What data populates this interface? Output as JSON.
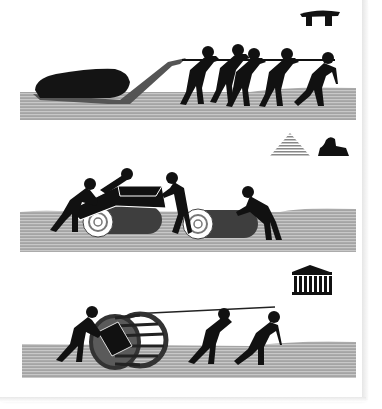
{
  "illustration": {
    "title": "Methods of moving heavy stones in antiquity",
    "colors": {
      "figure": "#111111",
      "stone": "#1a1a1a",
      "ground": "#9a9a9a",
      "ground_stripe": "#bdbdbd",
      "sled": "#5a5a5a",
      "roller": "#4a4a4a",
      "background": "#ffffff"
    },
    "panels": [
      {
        "id": "sledge",
        "era_icon": "dolmen-icon",
        "era_label": "Megalithic (dolmen)",
        "description": "Five figures pull a rope hauling a large stone on a wooden sledge",
        "figure_count": 5
      },
      {
        "id": "rollers",
        "era_icon": "pyramid-sphinx-icon",
        "era_label": "Ancient Egypt (pyramid and sphinx)",
        "description": "Four figures move a stone block over log rollers",
        "figure_count": 4
      },
      {
        "id": "cage-wheel",
        "era_icon": "greek-temple-icon",
        "era_label": "Ancient Greece (temple)",
        "description": "Three figures roll a stone block enclosed in a wooden cage wheel using a rope",
        "figure_count": 3
      }
    ]
  }
}
